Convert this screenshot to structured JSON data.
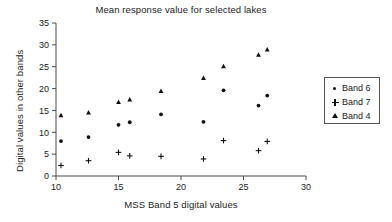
{
  "chart_data": {
    "type": "scatter",
    "title": "Mean response value for selected lakes",
    "xlabel": "MSS Band 5 digital values",
    "ylabel": "Digital values in other bands",
    "xlim": [
      10,
      30
    ],
    "ylim": [
      0,
      35
    ],
    "xticks": [
      10,
      15,
      20,
      25,
      30
    ],
    "yticks": [
      0,
      5,
      10,
      15,
      20,
      25,
      30,
      35
    ],
    "grid": false,
    "legend_position": "right",
    "series": [
      {
        "name": "Band 6",
        "marker": "dot",
        "color": "#111111",
        "points": [
          {
            "x": 10.4,
            "y": 8.0
          },
          {
            "x": 12.6,
            "y": 8.9
          },
          {
            "x": 15.0,
            "y": 11.7
          },
          {
            "x": 15.9,
            "y": 12.3
          },
          {
            "x": 18.4,
            "y": 14.1
          },
          {
            "x": 21.8,
            "y": 12.4
          },
          {
            "x": 23.4,
            "y": 19.6
          },
          {
            "x": 26.2,
            "y": 16.1
          },
          {
            "x": 26.9,
            "y": 18.4
          }
        ]
      },
      {
        "name": "Band 7",
        "marker": "plus",
        "color": "#111111",
        "points": [
          {
            "x": 10.4,
            "y": 2.4
          },
          {
            "x": 12.6,
            "y": 3.5
          },
          {
            "x": 15.0,
            "y": 5.4
          },
          {
            "x": 15.9,
            "y": 4.6
          },
          {
            "x": 18.4,
            "y": 4.5
          },
          {
            "x": 21.8,
            "y": 3.9
          },
          {
            "x": 23.4,
            "y": 8.1
          },
          {
            "x": 26.2,
            "y": 5.8
          },
          {
            "x": 26.9,
            "y": 7.9
          }
        ]
      },
      {
        "name": "Band 4",
        "marker": "triangle",
        "color": "#111111",
        "points": [
          {
            "x": 10.4,
            "y": 13.9
          },
          {
            "x": 12.6,
            "y": 14.5
          },
          {
            "x": 15.0,
            "y": 16.9
          },
          {
            "x": 15.9,
            "y": 17.5
          },
          {
            "x": 18.4,
            "y": 19.4
          },
          {
            "x": 21.8,
            "y": 22.4
          },
          {
            "x": 23.4,
            "y": 25.1
          },
          {
            "x": 26.2,
            "y": 27.7
          },
          {
            "x": 26.9,
            "y": 28.9
          }
        ]
      }
    ]
  },
  "legend": {
    "entries": [
      {
        "label": "Band 6",
        "marker": "dot"
      },
      {
        "label": "Band 7",
        "marker": "plus"
      },
      {
        "label": "Band 4",
        "marker": "triangle"
      }
    ]
  }
}
